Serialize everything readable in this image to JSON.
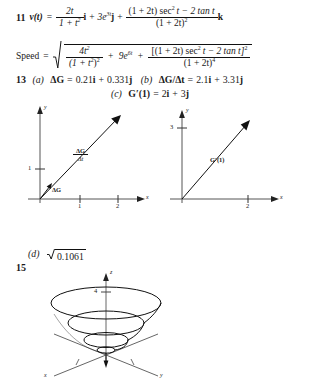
{
  "page": {
    "background_color": "#ffffff",
    "ink_color": "#1a1a1a"
  },
  "problems": [
    {
      "number": "11",
      "lines": [
        {
          "id": "velocity",
          "lhs": "v(t) =",
          "terms": [
            {
              "frac_num": "2t",
              "frac_den": "1 + t",
              "frac_den_sup": "2",
              "unit": "i"
            },
            {
              "plain": "3e",
              "sup": "3t",
              "unit": "j"
            },
            {
              "frac_num": "(1 + 2t) sec",
              "frac_num_sup": "2",
              "frac_num_rest": "t − 2 tan t",
              "frac_den": "(1 + 2t)",
              "frac_den_sup": "2",
              "unit": "k"
            }
          ]
        },
        {
          "id": "speed",
          "lhs": "Speed =",
          "radicand_terms": [
            {
              "frac_num": "4t",
              "frac_num_sup": "2",
              "frac_den": "(1 + t",
              "frac_den_sup": "2",
              "frac_den_rest": ")",
              "frac_den_sup2": "2"
            },
            {
              "plain": "9e",
              "sup": "6t"
            },
            {
              "frac_num": "[(1 + 2t) sec",
              "frac_num_sup": "2",
              "frac_num_rest": "t − 2 tan t]",
              "frac_num_sup2": "2",
              "frac_den": "(1 + 2t)",
              "frac_den_sup": "4"
            }
          ]
        }
      ]
    },
    {
      "number": "13",
      "parts": [
        {
          "label": "(a)",
          "text": "ΔG = 0.21i + 0.331j"
        },
        {
          "label": "(b)",
          "text": "ΔG/Δt = 2.1i + 3.31j"
        },
        {
          "label": "(c)",
          "text": "G′(1) = 2i + 3j"
        },
        {
          "label": "(d)",
          "text": "√0.1061",
          "radicand": "0.1061"
        }
      ]
    },
    {
      "number": "15",
      "figure": "conical-spiral-3d"
    }
  ],
  "equations": {
    "eq11": {
      "number": "11",
      "lhs": "v(t)",
      "equals": "=",
      "t1_num": "2t",
      "t1_den": "1 + t",
      "t1_den_exp": "2",
      "t1_unit": "i",
      "plus1": "+",
      "t2": "3e",
      "t2_exp": "3t",
      "t2_unit": "j",
      "plus2": "+",
      "t3_num_a": "(1 + 2t) sec",
      "t3_num_exp": "2",
      "t3_num_b": "t − 2 tan t",
      "t3_den": "(1 + 2t)",
      "t3_den_exp": "2",
      "t3_unit": "k"
    },
    "eqspeed": {
      "lhs": "Speed",
      "equals": "=",
      "s1_num": "4t",
      "s1_num_exp": "2",
      "s1_den_a": "(1 + t",
      "s1_den_exp_inner": "2",
      "s1_den_b": ")",
      "s1_den_exp_outer": "2",
      "plus1": "+",
      "s2": "9e",
      "s2_exp": "6t",
      "plus2": "+",
      "s3_num_a": "[(1 + 2t) sec",
      "s3_num_exp_inner": "2",
      "s3_num_b": "t − 2 tan t]",
      "s3_num_exp_outer": "2",
      "s3_den": "(1 + 2t)",
      "s3_den_exp": "4"
    },
    "eq13": {
      "number": "13",
      "a_label": "(a)",
      "a_text": "ΔG = 0.21i + 0.331j",
      "a_lhs": "ΔG",
      "a_eq": "=",
      "a_rhs_1": "0.21",
      "a_rhs_i": "i",
      "a_plus": "+",
      "a_rhs_2": "0.331",
      "a_rhs_j": "j",
      "b_label": "(b)",
      "b_lhs": "ΔG/Δt",
      "b_eq": "=",
      "b_rhs_1": "2.1",
      "b_rhs_i": "i",
      "b_plus": "+",
      "b_rhs_2": "3.31",
      "b_rhs_j": "j",
      "c_label": "(c)",
      "c_lhs": "G′(1)",
      "c_eq": "=",
      "c_rhs_1": "2",
      "c_rhs_i": "i",
      "c_plus": "+",
      "c_rhs_2": "3",
      "c_rhs_j": "j",
      "d_label": "(d)",
      "d_radical": "√",
      "d_radicand": "0.1061"
    },
    "num15": "15"
  },
  "figures": {
    "left_graph": {
      "name": "delta-G-over-delta-t-graph",
      "x_axis_label": "x",
      "y_axis_label": "y",
      "x_ticks": [
        "1",
        "2"
      ],
      "y_ticks": [
        "1"
      ],
      "vectors": [
        {
          "name": "delta-G",
          "label_top": "ΔG",
          "label_bottom": "",
          "kind": "plain"
        },
        {
          "name": "delta-G-over-delta-t",
          "label_top": "ΔG",
          "label_bottom": "Δt",
          "kind": "fraction"
        }
      ]
    },
    "right_graph": {
      "name": "G-prime-1-graph",
      "x_axis_label": "x",
      "y_axis_label": "y",
      "x_ticks": [
        "2"
      ],
      "y_ticks": [
        "3"
      ],
      "vectors": [
        {
          "name": "G-prime-1",
          "label": "G′(1)"
        }
      ]
    },
    "spiral_3d": {
      "name": "conical-spiral",
      "z_axis_label": "z",
      "x_axis_label": "x",
      "y_axis_label": "y",
      "z_ticks": [
        "4"
      ],
      "turns": 4
    }
  }
}
